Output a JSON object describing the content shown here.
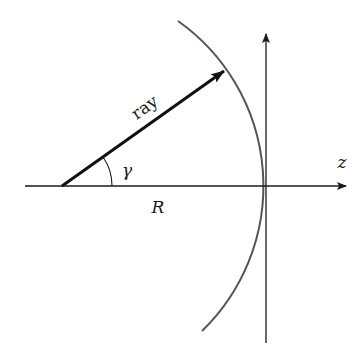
{
  "diagram": {
    "type": "geometry",
    "labels": {
      "ray": "ray",
      "angle": "γ",
      "radius": "R",
      "axis": "z"
    },
    "colors": {
      "axes": "#1a1a1a",
      "ray": "#111111",
      "arc": "#555555",
      "background": "#ffffff"
    },
    "geometry": {
      "origin": [
        62,
        186
      ],
      "ray_tip": [
        225,
        70
      ],
      "arc_radius_px": 202,
      "horizontal_axis": {
        "from": [
          25,
          186
        ],
        "to": [
          347,
          186
        ]
      },
      "vertical_axis": {
        "from": [
          266,
          343
        ],
        "to": [
          266,
          33
        ]
      }
    }
  }
}
